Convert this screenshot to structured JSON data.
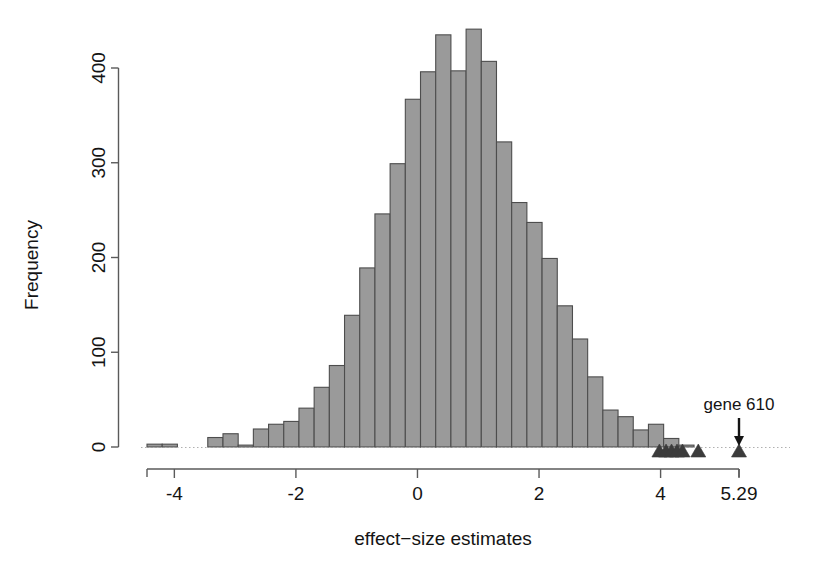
{
  "figure": {
    "title": "",
    "background": "#ffffff"
  },
  "axes": {
    "x_label": "effect−size estimates",
    "y_label": "Frequency",
    "x_ticks": [
      "-4",
      "-2",
      "0",
      "2",
      "4",
      "5.29"
    ],
    "x_tick_values": [
      -4,
      -2,
      0,
      2,
      4,
      5.29
    ],
    "y_ticks": [
      "0",
      "100",
      "200",
      "300",
      "400"
    ],
    "y_tick_values": [
      0,
      100,
      200,
      300,
      400
    ],
    "x_range": [
      -4.45,
      5.29
    ],
    "y_range": [
      0,
      445
    ]
  },
  "annotations": {
    "gene_label": "gene 610",
    "gene_label_x": 5.29,
    "arrow_name": "down-arrow"
  },
  "colors": {
    "bar_fill": "#9a9a9a",
    "bar_stroke": "#4d4d4d",
    "axis": "#5a5a5a",
    "text": "#141414",
    "marker": "#3b3b3b",
    "baseline": "#b0b0b0"
  },
  "chart_data": {
    "type": "bar",
    "title": "",
    "xlabel": "effect−size estimates",
    "ylabel": "Frequency",
    "xlim": [
      -4.45,
      5.29
    ],
    "ylim": [
      0,
      445
    ],
    "grid": false,
    "legend": null,
    "bin_width": 0.25,
    "bin_starts": [
      -4.45,
      -4.2,
      -3.95,
      -3.7,
      -3.45,
      -3.2,
      -2.95,
      -2.7,
      -2.45,
      -2.2,
      -1.95,
      -1.7,
      -1.45,
      -1.2,
      -0.95,
      -0.7,
      -0.45,
      -0.2,
      0.05,
      0.3,
      0.55,
      0.8,
      1.05,
      1.3,
      1.55,
      1.8,
      2.05,
      2.3,
      2.55,
      2.8,
      3.05,
      3.3,
      3.55,
      3.8,
      4.05,
      4.3,
      4.55,
      4.8,
      5.05
    ],
    "values": [
      3,
      3,
      0,
      0,
      10,
      14,
      2,
      19,
      24,
      27,
      41,
      63,
      86,
      139,
      189,
      246,
      299,
      367,
      396,
      435,
      397,
      441,
      407,
      322,
      258,
      237,
      199,
      149,
      114,
      74,
      39,
      32,
      18,
      24,
      9,
      2,
      0,
      0,
      0
    ],
    "categories": [
      "-4.45",
      "-4.20",
      "-3.95",
      "-3.70",
      "-3.45",
      "-3.20",
      "-2.95",
      "-2.70",
      "-2.45",
      "-2.20",
      "-1.95",
      "-1.70",
      "-1.45",
      "-1.20",
      "-0.95",
      "-0.70",
      "-0.45",
      "-0.20",
      "0.05",
      "0.30",
      "0.55",
      "0.80",
      "1.05",
      "1.30",
      "1.55",
      "1.80",
      "2.05",
      "2.30",
      "2.55",
      "2.80",
      "3.05",
      "3.30",
      "3.55",
      "3.80",
      "4.05",
      "4.30",
      "4.55",
      "4.80",
      "5.05"
    ],
    "markers": {
      "name": "rug-triangles",
      "x": [
        3.98,
        4.09,
        4.18,
        4.27,
        4.36,
        4.62,
        5.29
      ],
      "shape": "triangle-up"
    },
    "annotations": [
      {
        "text": "gene 610",
        "x": 5.29,
        "y": 55,
        "arrow": true
      }
    ]
  }
}
